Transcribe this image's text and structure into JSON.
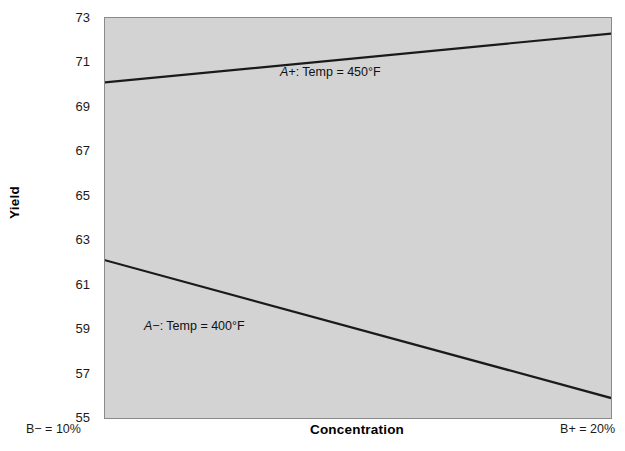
{
  "chart_data": {
    "type": "line",
    "title": "",
    "subtitle": "",
    "xlabel": "Concentration",
    "ylabel": "Yield",
    "x": [
      "B- = 10%",
      "B+ = 20%"
    ],
    "x_tick_labels": [
      "B− = 10%",
      "B+ = 20%"
    ],
    "xlim": [
      0,
      1
    ],
    "ylim": [
      55,
      73
    ],
    "y_ticks": [
      55,
      57,
      59,
      61,
      63,
      65,
      67,
      69,
      71,
      73
    ],
    "y_tick_labels": [
      "55",
      "57",
      "59",
      "61",
      "63",
      "65",
      "67",
      "69",
      "71",
      "73"
    ],
    "grid": false,
    "legend_position": "inline-annotation",
    "series": [
      {
        "name": "A+: Temp = 450°F",
        "code": "A+",
        "label": ": Temp = 450°F",
        "values": [
          70.1,
          72.3
        ],
        "color": "#1a1a1a"
      },
      {
        "name": "A−: Temp = 400°F",
        "code": "A−",
        "label": ": Temp = 400°F",
        "values": [
          62.1,
          55.9
        ],
        "color": "#1a1a1a"
      }
    ],
    "annotations": [
      {
        "text": "A+: Temp = 450°F",
        "series": 0
      },
      {
        "text": "A−: Temp = 400°F",
        "series": 1
      }
    ]
  },
  "axes": {
    "y_title": "Yield",
    "x_title": "Concentration",
    "y_tick_labels": [
      "73",
      "71",
      "69",
      "67",
      "65",
      "63",
      "61",
      "59",
      "57",
      "55"
    ],
    "x_low_label": "B− = 10%",
    "x_high_label": "B+ = 20%"
  },
  "annotations": {
    "a_plus_code": "A+",
    "a_plus_text": ": Temp = 450°F",
    "a_minus_code": "A−",
    "a_minus_text": ": Temp = 400°F"
  },
  "colors": {
    "plot_background": "#d3d3d3",
    "page_background": "#ffffff",
    "line": "#1a1a1a",
    "frame": "#8a8a8a",
    "text": "#1a1a1a"
  }
}
